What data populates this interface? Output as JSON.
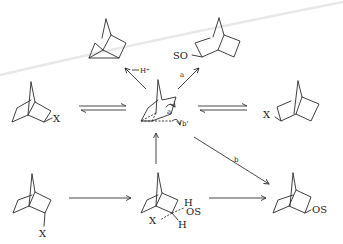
{
  "diagram": {
    "labels": {
      "proton": "H⁺",
      "path_a": "a",
      "path_b": "b",
      "path_b_prime": "b'",
      "so_substituent": "SO",
      "x_left": "X",
      "x_right": "X",
      "x_bottom_left": "X",
      "x_center_bottom": "X",
      "h_top": "H",
      "os_center": "OS",
      "h_bottom": "H",
      "os_product": "OS",
      "curly_a": "a",
      "curly_b": "b'"
    },
    "nodes": [
      {
        "id": "nortricyclene",
        "desc": "tricyclic product (top-left)"
      },
      {
        "id": "exo-SO-product",
        "desc": "exo-2-norbornyl ether (top-right)"
      },
      {
        "id": "exo-X",
        "desc": "exo-2-norbornyl-X (left)"
      },
      {
        "id": "cation",
        "desc": "nonclassical norbornyl cation (center)"
      },
      {
        "id": "endo-X-right",
        "desc": "2-norbornyl-X (right)"
      },
      {
        "id": "endo-X",
        "desc": "endo-2-norbornyl-X (bottom-left)"
      },
      {
        "id": "SN2-TS",
        "desc": "solvent-assisted transition state (bottom-center)"
      },
      {
        "id": "exo-OS-product",
        "desc": "exo-2-norbornyl-OS (bottom-right)"
      }
    ],
    "edges": [
      {
        "from": "cation",
        "to": "nortricyclene",
        "label": "H⁺"
      },
      {
        "from": "cation",
        "to": "exo-SO-product",
        "label": "a"
      },
      {
        "from": "exo-X",
        "to": "cation",
        "type": "equilibrium"
      },
      {
        "from": "cation",
        "to": "endo-X-right",
        "type": "equilibrium"
      },
      {
        "from": "endo-X",
        "to": "SN2-TS"
      },
      {
        "from": "SN2-TS",
        "to": "cation"
      },
      {
        "from": "SN2-TS",
        "to": "exo-OS-product"
      },
      {
        "from": "cation",
        "to": "exo-OS-product",
        "label": "b"
      }
    ]
  }
}
